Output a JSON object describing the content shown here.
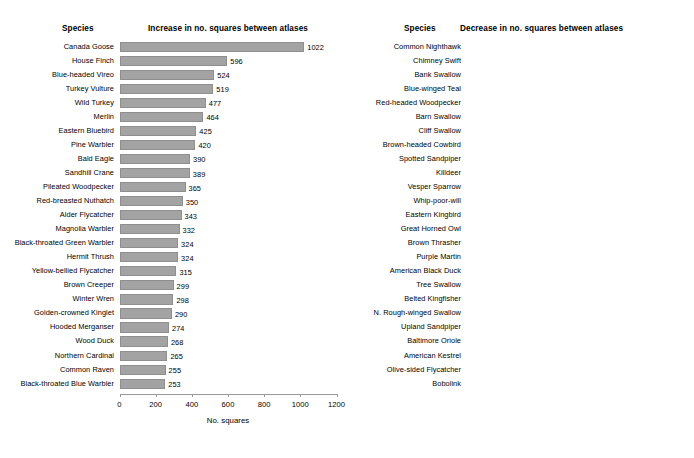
{
  "chart_data": [
    {
      "type": "bar",
      "orientation": "horizontal",
      "panel": "left",
      "title": "Increase in no. squares between atlases",
      "category_header": "Species",
      "xlabel": "No. squares",
      "ylabel": "",
      "xlim": [
        0,
        1200
      ],
      "xticks": [
        0,
        200,
        400,
        600,
        800,
        1000,
        1200
      ],
      "xticklabels": [
        "0",
        "200",
        "400",
        "600",
        "800",
        "1000",
        "1200"
      ],
      "grid": false,
      "legend": null,
      "bar_color": "#a3a3a3",
      "categories": [
        "Canada Goose",
        "House Finch",
        "Blue-headed Vireo",
        "Turkey Vulture",
        "Wild Turkey",
        "Merlin",
        "Eastern Bluebird",
        "Pine Warbler",
        "Bald Eagle",
        "Sandhill Crane",
        "Pileated Woodpecker",
        "Red-breasted Nuthatch",
        "Alder Flycatcher",
        "Magnolia Warbler",
        "Black-throated Green Warbler",
        "Hermit Thrush",
        "Yellow-bellied Flycatcher",
        "Brown Creeper",
        "Winter Wren",
        "Golden-crowned Kinglet",
        "Hooded Merganser",
        "Wood Duck",
        "Northern Cardinal",
        "Common Raven",
        "Black-throated Blue Warbler"
      ],
      "values": [
        1022,
        596,
        524,
        519,
        477,
        464,
        425,
        420,
        390,
        389,
        365,
        350,
        343,
        332,
        324,
        324,
        315,
        299,
        298,
        290,
        274,
        268,
        265,
        255,
        253
      ],
      "value_labels": [
        "1022",
        "596",
        "524",
        "519",
        "477",
        "464",
        "425",
        "420",
        "390",
        "389",
        "365",
        "350",
        "343",
        "332",
        "324",
        "324",
        "315",
        "299",
        "298",
        "290",
        "274",
        "268",
        "265",
        "255",
        "253"
      ]
    },
    {
      "type": "bar",
      "orientation": "horizontal",
      "panel": "right",
      "title": "Decrease in no. squares between atlases",
      "category_header": "Species",
      "xlabel": "No. squares",
      "ylabel": "",
      "xlim": [
        0,
        -1200
      ],
      "xticks": [
        0,
        -200,
        -400,
        -600,
        -800,
        -1000,
        -1200
      ],
      "xticklabels": [
        "0",
        "-200",
        "-400",
        "-600",
        "-800",
        "-1000",
        "-1200"
      ],
      "grid": false,
      "legend": null,
      "bar_color": "#a3a3a3",
      "categories": [
        "Common Nighthawk",
        "Chimney Swift",
        "Bank Swallow",
        "Blue-winged Teal",
        "Red-headed Woodpecker",
        "Barn Swallow",
        "Cliff Swallow",
        "Brown-headed Cowbird",
        "Spotted Sandpiper",
        "Killdeer",
        "Vesper Sparrow",
        "Whip-poor-will",
        "Eastern Kingbird",
        "Great Horned Owl",
        "Brown Thrasher",
        "Purple Martin",
        "American Black Duck",
        "Tree Swallow",
        "Belted Kingfisher",
        "N. Rough-winged Swallow",
        "Upland Sandpiper",
        "Baltimore Oriole",
        "American Kestrel",
        "Olive-sided Flycatcher",
        "Bobolink"
      ],
      "values": [
        -545,
        -485,
        -465,
        -367,
        -354,
        -351,
        -335,
        -326,
        -316,
        -314,
        -309,
        -307,
        -295,
        -290,
        -288,
        -287,
        -270,
        -243,
        -237,
        -234,
        -232,
        -227,
        -205,
        -200,
        -193
      ],
      "value_labels": [
        "-545",
        "-485",
        "-465",
        "-367",
        "-354",
        "-351",
        "-335",
        "-326",
        "-316",
        "-314",
        "-309",
        "-307",
        "-295",
        "-290",
        "-288",
        "-287",
        "-270",
        "-243",
        "-237",
        "-234",
        "-232",
        "-227",
        "-205",
        "-200",
        "-193"
      ]
    }
  ]
}
